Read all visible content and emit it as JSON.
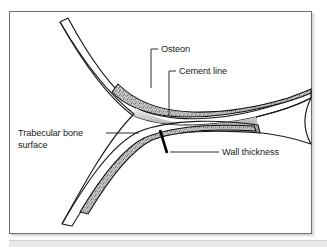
{
  "figure": {
    "frame_border_color": "#6e6e6e",
    "background_color": "#ffffff",
    "bottom_band_color": "#e8e8e8"
  },
  "callouts": [
    {
      "id": "osteon",
      "label": "Osteon",
      "text_x": 151,
      "text_y": 40,
      "anchor": "start",
      "leader": "M 148 37 L 141 37 L 141 74",
      "target": "stippled band, upper-left trabecula"
    },
    {
      "id": "cement-line",
      "label": "Cement line",
      "text_x": 169,
      "text_y": 62,
      "anchor": "start",
      "leader": "M 166 59 L 159 59 L 159 103",
      "target": "dark boundary line of osteon"
    },
    {
      "id": "trabecular-bone-surface",
      "label_line_1": "Trabecular bone",
      "label_line_2": "surface",
      "text_x": 8,
      "text_y": 124,
      "anchor": "start",
      "leader": "M 96 121 L 128 121",
      "target": "outer concave edge of trabecula"
    },
    {
      "id": "wall-thickness",
      "label": "Wall thickness",
      "text_x": 212,
      "text_y": 143,
      "anchor": "start",
      "leader": "M 209 140 L 178 140",
      "target": "thick black bar across trabecula wall"
    }
  ],
  "structure": {
    "shape": "Y-shaped trabecular junction",
    "arms": [
      "upper-left",
      "right",
      "lower-left"
    ],
    "osteon_fill": "stippled grey texture",
    "bone_fill": "vertical linear gradient light-to-dark grey",
    "outline_color": "#1a1a1a"
  },
  "markers": {
    "wall_thickness_bar": {
      "x1": 150,
      "y1": 120,
      "x2": 156,
      "y2": 143,
      "color": "#000000"
    }
  }
}
